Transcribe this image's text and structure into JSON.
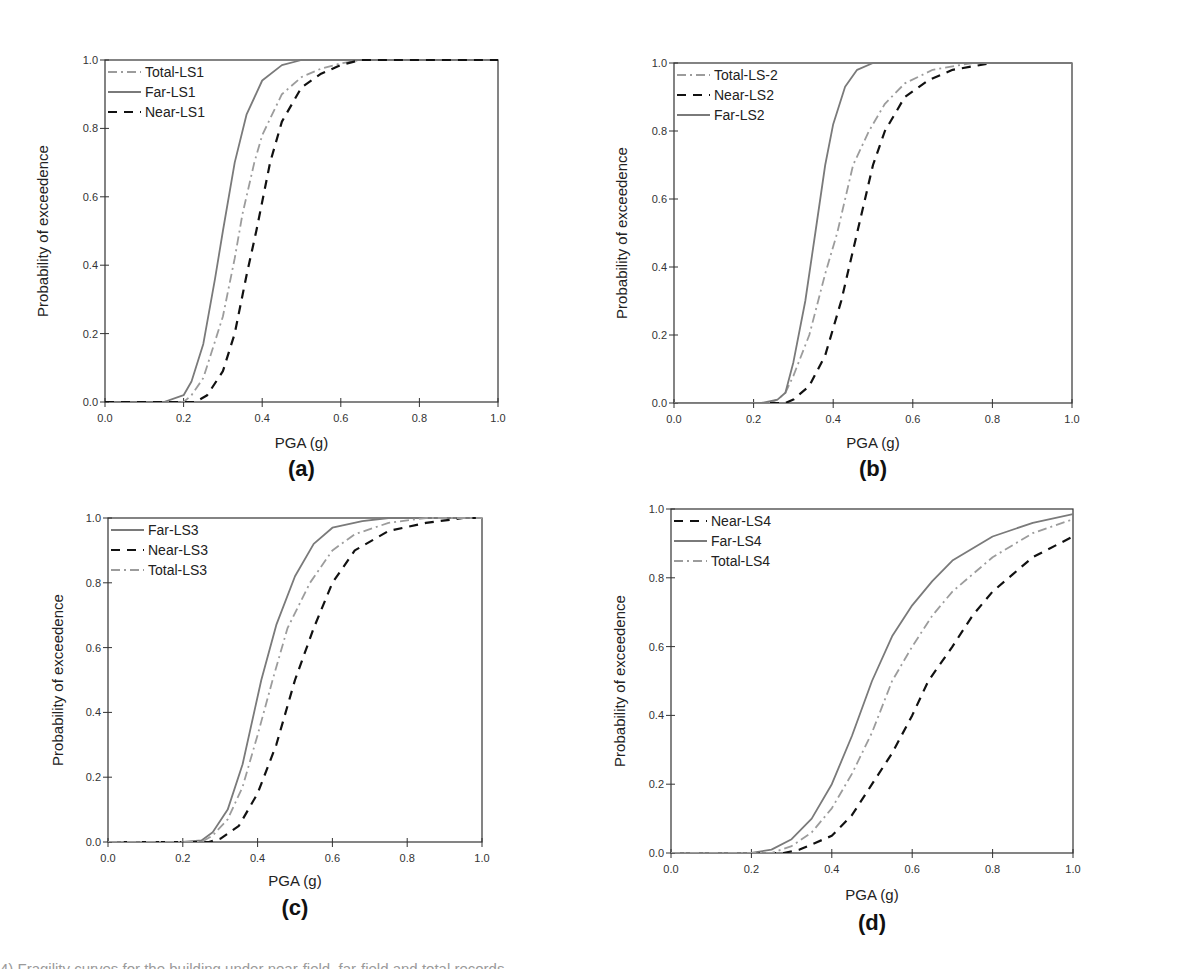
{
  "figure": {
    "caption": "4) Fragility curves for the building under near-field, far-field and total records"
  },
  "colors": {
    "far": "#7a7a7a",
    "total": "#9c9c9c",
    "near": "#111111",
    "axis": "#333333"
  },
  "chart_data": [
    {
      "type": "line",
      "panel_label": "(a)",
      "title": "",
      "xlabel": "PGA (g)",
      "ylabel": "Probability of exceedence",
      "xlim": [
        0,
        1
      ],
      "ylim": [
        0,
        1
      ],
      "xticks": [
        "0.0",
        "0.2",
        "0.4",
        "0.6",
        "0.8",
        "1.0"
      ],
      "yticks": [
        "0.0",
        "0.2",
        "0.4",
        "0.6",
        "0.8",
        "1.0"
      ],
      "grid": false,
      "legend_position": "upper left",
      "legend": [
        "Total-LS1",
        "Far-LS1",
        "Near-LS1"
      ],
      "layout": {
        "left": 105,
        "right": 498,
        "top": 60,
        "bottom": 402,
        "ylabel_x": 48,
        "xlabel_y": 448,
        "panel_label_y": 476
      },
      "series": [
        {
          "name": "Total-LS1",
          "style": "dashdot",
          "x": [
            0,
            0.2,
            0.22,
            0.25,
            0.3,
            0.33,
            0.35,
            0.38,
            0.4,
            0.45,
            0.5,
            0.55,
            0.6,
            0.65,
            1.0
          ],
          "values": [
            0,
            0,
            0.02,
            0.07,
            0.25,
            0.42,
            0.55,
            0.7,
            0.78,
            0.9,
            0.95,
            0.975,
            0.99,
            1.0,
            1.0
          ]
        },
        {
          "name": "Far-LS1",
          "style": "solid",
          "x": [
            0,
            0.15,
            0.2,
            0.22,
            0.25,
            0.28,
            0.3,
            0.33,
            0.36,
            0.4,
            0.45,
            0.5,
            1.0
          ],
          "values": [
            0,
            0,
            0.02,
            0.06,
            0.17,
            0.36,
            0.5,
            0.7,
            0.84,
            0.94,
            0.985,
            1.0,
            1.0
          ]
        },
        {
          "name": "Near-LS1",
          "style": "dashed",
          "x": [
            0,
            0.23,
            0.26,
            0.3,
            0.33,
            0.36,
            0.385,
            0.42,
            0.45,
            0.5,
            0.55,
            0.6,
            0.65,
            1.0
          ],
          "values": [
            0,
            0,
            0.02,
            0.09,
            0.2,
            0.37,
            0.5,
            0.7,
            0.82,
            0.92,
            0.96,
            0.985,
            1.0,
            1.0
          ]
        }
      ]
    },
    {
      "type": "line",
      "panel_label": "(b)",
      "title": "",
      "xlabel": "PGA (g)",
      "ylabel": "Probability of exceedence",
      "xlim": [
        0,
        1
      ],
      "ylim": [
        0,
        1
      ],
      "xticks": [
        "0.0",
        "0.2",
        "0.4",
        "0.6",
        "0.8",
        "1.0"
      ],
      "yticks": [
        "0.0",
        "0.2",
        "0.4",
        "0.6",
        "0.8",
        "1.0"
      ],
      "grid": false,
      "legend_position": "upper left",
      "legend": [
        "Total-LS-2",
        "Near-LS2",
        "Far-LS2"
      ],
      "layout": {
        "left": 674,
        "right": 1072,
        "top": 63,
        "bottom": 403,
        "ylabel_x": 627,
        "xlabel_y": 448,
        "panel_label_y": 476
      },
      "series": [
        {
          "name": "Total-LS-2",
          "style": "dashdot",
          "x": [
            0,
            0.24,
            0.26,
            0.28,
            0.3,
            0.34,
            0.38,
            0.41,
            0.45,
            0.49,
            0.53,
            0.58,
            0.65,
            0.75,
            1.0
          ],
          "values": [
            0,
            0,
            0.01,
            0.03,
            0.08,
            0.2,
            0.38,
            0.5,
            0.7,
            0.8,
            0.88,
            0.94,
            0.98,
            1.0,
            1.0
          ]
        },
        {
          "name": "Near-LS2",
          "style": "dashed",
          "x": [
            0,
            0.28,
            0.3,
            0.34,
            0.38,
            0.42,
            0.46,
            0.5,
            0.53,
            0.58,
            0.64,
            0.7,
            0.8,
            1.0
          ],
          "values": [
            0,
            0,
            0.01,
            0.05,
            0.14,
            0.3,
            0.5,
            0.7,
            0.8,
            0.9,
            0.95,
            0.98,
            1.0,
            1.0
          ]
        },
        {
          "name": "Far-LS2",
          "style": "solid",
          "x": [
            0,
            0.22,
            0.26,
            0.28,
            0.3,
            0.33,
            0.355,
            0.38,
            0.4,
            0.43,
            0.46,
            0.5,
            1.0
          ],
          "values": [
            0,
            0,
            0.01,
            0.03,
            0.12,
            0.3,
            0.5,
            0.7,
            0.82,
            0.93,
            0.98,
            1.0,
            1.0
          ]
        }
      ]
    },
    {
      "type": "line",
      "panel_label": "(c)",
      "title": "",
      "xlabel": "PGA (g)",
      "ylabel": "Probability of exceedence",
      "xlim": [
        0,
        1
      ],
      "ylim": [
        0,
        1
      ],
      "xticks": [
        "0.0",
        "0.2",
        "0.4",
        "0.6",
        "0.8",
        "1.0"
      ],
      "yticks": [
        "0.0",
        "0.2",
        "0.4",
        "0.6",
        "0.8",
        "1.0"
      ],
      "grid": false,
      "legend_position": "upper left",
      "legend": [
        "Far-LS3",
        "Near-LS3",
        "Total-LS3"
      ],
      "layout": {
        "left": 108,
        "right": 482,
        "top": 518,
        "bottom": 842,
        "ylabel_x": 63,
        "xlabel_y": 886,
        "panel_label_y": 915
      },
      "series": [
        {
          "name": "Far-LS3",
          "style": "solid",
          "x": [
            0,
            0.2,
            0.25,
            0.28,
            0.32,
            0.36,
            0.41,
            0.45,
            0.5,
            0.55,
            0.6,
            0.68,
            0.75,
            1.0
          ],
          "values": [
            0,
            0,
            0.005,
            0.03,
            0.1,
            0.24,
            0.5,
            0.67,
            0.82,
            0.92,
            0.97,
            0.99,
            1.0,
            1.0
          ]
        },
        {
          "name": "Near-LS3",
          "style": "dashed",
          "x": [
            0,
            0.27,
            0.3,
            0.35,
            0.4,
            0.45,
            0.5,
            0.55,
            0.6,
            0.66,
            0.75,
            0.85,
            0.95,
            1.0
          ],
          "values": [
            0,
            0,
            0.01,
            0.05,
            0.15,
            0.3,
            0.5,
            0.66,
            0.8,
            0.9,
            0.96,
            0.985,
            1.0,
            1.0
          ]
        },
        {
          "name": "Total-LS3",
          "style": "dashdot",
          "x": [
            0,
            0.25,
            0.28,
            0.32,
            0.36,
            0.4,
            0.44,
            0.48,
            0.54,
            0.6,
            0.66,
            0.75,
            0.85,
            1.0
          ],
          "values": [
            0,
            0,
            0.02,
            0.07,
            0.17,
            0.33,
            0.5,
            0.66,
            0.8,
            0.9,
            0.95,
            0.985,
            1.0,
            1.0
          ]
        }
      ]
    },
    {
      "type": "line",
      "panel_label": "(d)",
      "title": "",
      "xlabel": "PGA (g)",
      "ylabel": "Probability of exceedence",
      "xlim": [
        0,
        1
      ],
      "ylim": [
        0,
        1
      ],
      "xticks": [
        "0.0",
        "0.2",
        "0.4",
        "0.6",
        "0.8",
        "1.0"
      ],
      "yticks": [
        "0.0",
        "0.2",
        "0.4",
        "0.6",
        "0.8",
        "1.0"
      ],
      "grid": false,
      "legend_position": "upper left",
      "legend": [
        "Near-LS4",
        "Far-LS4",
        "Total-LS4"
      ],
      "layout": {
        "left": 671,
        "right": 1073,
        "top": 509,
        "bottom": 853,
        "ylabel_x": 625,
        "xlabel_y": 900,
        "panel_label_y": 930
      },
      "series": [
        {
          "name": "Near-LS4",
          "style": "dashed",
          "x": [
            0,
            0.28,
            0.32,
            0.36,
            0.4,
            0.45,
            0.5,
            0.55,
            0.6,
            0.64,
            0.7,
            0.75,
            0.8,
            0.85,
            0.9,
            1.0
          ],
          "values": [
            0,
            0,
            0.01,
            0.03,
            0.05,
            0.11,
            0.2,
            0.29,
            0.4,
            0.5,
            0.6,
            0.69,
            0.76,
            0.81,
            0.86,
            0.92
          ]
        },
        {
          "name": "Far-LS4",
          "style": "solid",
          "x": [
            0,
            0.2,
            0.25,
            0.3,
            0.35,
            0.4,
            0.45,
            0.5,
            0.55,
            0.6,
            0.65,
            0.7,
            0.8,
            0.9,
            1.0
          ],
          "values": [
            0,
            0,
            0.01,
            0.04,
            0.1,
            0.2,
            0.34,
            0.5,
            0.63,
            0.72,
            0.79,
            0.85,
            0.92,
            0.96,
            0.985
          ]
        },
        {
          "name": "Total-LS4",
          "style": "dashdot",
          "x": [
            0,
            0.25,
            0.3,
            0.35,
            0.4,
            0.45,
            0.5,
            0.55,
            0.6,
            0.65,
            0.7,
            0.8,
            0.9,
            1.0
          ],
          "values": [
            0,
            0,
            0.02,
            0.06,
            0.13,
            0.23,
            0.35,
            0.5,
            0.6,
            0.69,
            0.76,
            0.86,
            0.93,
            0.97
          ]
        }
      ]
    }
  ]
}
